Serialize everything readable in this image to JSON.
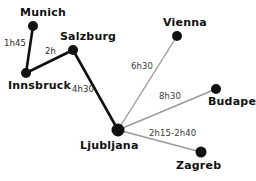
{
  "diagram": {
    "type": "travel-time-network-map",
    "background_color": "#ffffff",
    "node_color": "#111111",
    "primary_edge_color": "#111111",
    "secondary_edge_color": "#9a9a9a",
    "cities": [
      {
        "id": "munich",
        "name": "Munich",
        "x": 33,
        "y": 26,
        "r": 5.0,
        "label_x": 20,
        "label_y": 7
      },
      {
        "id": "salzburg",
        "name": "Salzburg",
        "x": 73,
        "y": 50,
        "r": 5.0,
        "label_x": 60,
        "label_y": 31
      },
      {
        "id": "innsbruck",
        "name": "Innsbruck",
        "x": 26,
        "y": 73,
        "r": 5.0,
        "label_x": 8,
        "label_y": 80
      },
      {
        "id": "vienna",
        "name": "Vienna",
        "x": 177,
        "y": 36,
        "r": 5.0,
        "label_x": 163,
        "label_y": 17
      },
      {
        "id": "budapest",
        "name": "Budapest",
        "x": 216,
        "y": 89,
        "r": 5.0,
        "label_x": 208,
        "label_y": 96
      },
      {
        "id": "ljubljana",
        "name": "Ljubljana",
        "x": 118,
        "y": 130,
        "r": 6.5,
        "label_x": 80,
        "label_y": 140
      },
      {
        "id": "zagreb",
        "name": "Zagreb",
        "x": 201,
        "y": 152,
        "r": 5.5,
        "label_x": 176,
        "label_y": 160
      }
    ],
    "connections": [
      {
        "id": "munich-innsbruck",
        "from": "munich",
        "to": "innsbruck",
        "duration": "1h45",
        "style": "primary",
        "width": 2.6,
        "label_x": 4,
        "label_y": 39
      },
      {
        "id": "innsbruck-salzburg",
        "from": "innsbruck",
        "to": "salzburg",
        "duration": "2h",
        "style": "primary",
        "width": 2.6,
        "label_x": 45,
        "label_y": 47
      },
      {
        "id": "salzburg-ljubljana",
        "from": "salzburg",
        "to": "ljubljana",
        "duration": "4h30",
        "style": "primary",
        "width": 2.6,
        "label_x": 72,
        "label_y": 85
      },
      {
        "id": "ljubljana-vienna",
        "from": "ljubljana",
        "to": "vienna",
        "duration": "6h30",
        "style": "secondary",
        "width": 1.4,
        "label_x": 131,
        "label_y": 62
      },
      {
        "id": "ljubljana-budapest",
        "from": "ljubljana",
        "to": "budapest",
        "duration": "8h30",
        "style": "secondary",
        "width": 1.4,
        "label_x": 159,
        "label_y": 92
      },
      {
        "id": "ljubljana-zagreb",
        "from": "ljubljana",
        "to": "zagreb",
        "duration": "2h15-2h40",
        "style": "secondary",
        "width": 1.4,
        "label_x": 149,
        "label_y": 129
      }
    ]
  }
}
